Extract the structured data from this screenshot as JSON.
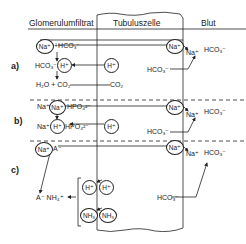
{
  "header": {
    "col1": "Glomerulumfiltrat",
    "col2": "Tubuluszelle",
    "col3": "Blut"
  },
  "sections": {
    "a": {
      "label": "a)",
      "filtrate": {
        "na": "Na⁺",
        "hco3_top": "+HCO₃⁻",
        "hco3_mid": "HCO₃⁻+",
        "h": "H⁺",
        "products": "H₂O + CO₂"
      },
      "cell": {
        "h": "H⁺",
        "na": "Na⁺",
        "co2": "CO₂",
        "hco3": "HCO₃⁻"
      },
      "blood": {
        "na": "Na⁺",
        "hco3": "HCO₃⁻"
      }
    },
    "b": {
      "label": "b)",
      "filtrate": {
        "na_free_top": "Na⁺",
        "na_circ": "Na⁺",
        "hpo4_top": "HPO₄²⁻",
        "na_free_bottom": "Na⁺",
        "h_circ": "H⁺",
        "hpo4_bottom": "HPO₄²⁻"
      },
      "cell": {
        "h": "H⁺",
        "na": "Na⁺",
        "hco3": "HCO₃⁻"
      },
      "blood": {
        "na": "Na⁺",
        "hco3": "HCO₃⁻"
      }
    },
    "c": {
      "label": "c)",
      "filtrate": {
        "na_circ": "Na⁺",
        "a_minus": "A⁻",
        "product": "A⁻ NH₄⁺",
        "h_circ": "H⁺",
        "nh3_circ": "NH₃"
      },
      "cell": {
        "h": "H⁺",
        "nh3": "NH₃",
        "na": "Na⁺",
        "hco3": "HCO₃⁻"
      },
      "blood": {
        "na": "Na⁺",
        "hco3": "HCO₃⁻"
      }
    }
  }
}
